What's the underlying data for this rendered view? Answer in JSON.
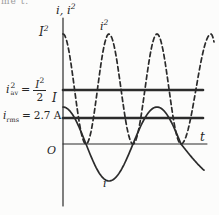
{
  "figure": {
    "page_fragment": "me t.",
    "ink_color": "#2b2b2b",
    "paper_color": "#fcfcfb",
    "axis": {
      "y_label_base": "i, i",
      "y_label_sup": "2",
      "x_label": "t",
      "origin_label": "O"
    },
    "ticks": {
      "I_squared_base": "I",
      "I_squared_sup": "2",
      "I_peak": "I"
    },
    "annotations": {
      "i_sq_av": {
        "base": "i",
        "sup": "2",
        "sub": "av",
        "equals": "=",
        "num_base": "I",
        "num_sup": "2",
        "den": "2"
      },
      "i_rms": {
        "base": "i",
        "sub": "rms",
        "equals": "=",
        "value": "2.7 A"
      },
      "curve_i_sq": {
        "base": "i",
        "sup": "2"
      },
      "curve_i": "i"
    }
  },
  "chart_data": {
    "type": "line",
    "xlabel": "t",
    "ylabel": "i, i²",
    "x_axis_origin_label": "O",
    "series": [
      {
        "name": "i",
        "style": "solid",
        "description": "i = I cos(ωt): sinusoid of peak amplitude I, maximum I at t = 0, oscillates between +I and -I"
      },
      {
        "name": "i²",
        "style": "dashed",
        "description": "i² = I²cos²(ωt): double frequency, oscillates between 0 and I², equals I² at t = 0"
      }
    ],
    "y_tick_labels": [
      "I²",
      "I²/2",
      "I",
      "0"
    ],
    "reference_lines": [
      {
        "name": "i_sq_av",
        "label": "i²av = I²/2",
        "level": "I²/2"
      },
      {
        "name": "i_rms",
        "label": "irms = 2.7 A",
        "level": "0.707 I"
      }
    ],
    "legend": "none",
    "grid": false,
    "geometry": {
      "axis_x_px": 63,
      "axis_y_px": 144,
      "y_axis_top_px": 18,
      "y_axis_bottom_px": 206,
      "x_axis_end_px": 207,
      "ref_line_end_px": 203,
      "i_amplitude_px": 37,
      "i_sq_amplitude_px": 110,
      "i_sq_av_level_px": 90,
      "i_rms_level_px": 118,
      "solid_phase_keys": [
        [
          63,
          0
        ],
        [
          86,
          1
        ],
        [
          109,
          2
        ],
        [
          133,
          3
        ],
        [
          157,
          4
        ],
        [
          181,
          5
        ],
        [
          227,
          6
        ]
      ],
      "solid_clip_px": 204,
      "dashed_phase_keys": [
        [
          63,
          0
        ],
        [
          86,
          1
        ],
        [
          109,
          2
        ],
        [
          133,
          3
        ],
        [
          157,
          4
        ],
        [
          181,
          5
        ],
        [
          211,
          6
        ],
        [
          224,
          6.75
        ]
      ],
      "dashed_clip_px": 214
    }
  }
}
